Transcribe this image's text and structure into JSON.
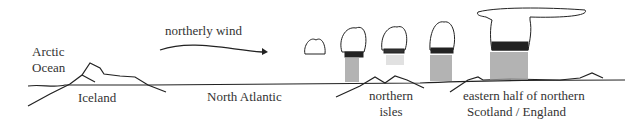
{
  "labels": {
    "arctic_ocean_line1": "Arctic",
    "arctic_ocean_line2": "Ocean",
    "wind": "northerly wind",
    "iceland": "Iceland",
    "north_atlantic": "North Atlantic",
    "northern_isles_line1": "northern",
    "northern_isles_line2": "isles",
    "east_line1": "eastern half of northern",
    "east_line2": "Scotland / England"
  },
  "colors": {
    "ink": "#222222",
    "text": "#333333",
    "shade": "#9a9a9a"
  }
}
